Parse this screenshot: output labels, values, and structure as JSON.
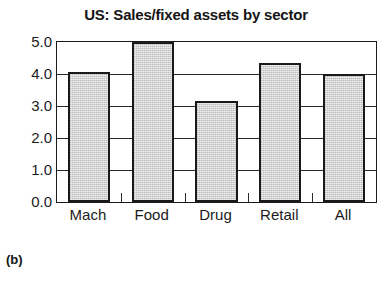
{
  "figure": {
    "caption": "(b)"
  },
  "chart_data": {
    "type": "bar",
    "title": "US: Sales/fixed assets by sector",
    "xlabel": "",
    "ylabel": "",
    "categories": [
      "Mach",
      "Food",
      "Drug",
      "Retail",
      "All"
    ],
    "values": [
      4.05,
      5.05,
      3.15,
      4.35,
      4.0
    ],
    "ylim": [
      0.0,
      5.0
    ],
    "ytick_labels": [
      "0.0",
      "1.0",
      "2.0",
      "3.0",
      "4.0",
      "5.0"
    ],
    "ytick_values": [
      0.0,
      1.0,
      2.0,
      3.0,
      4.0,
      5.0
    ],
    "grid": true,
    "legend": "none",
    "bar_fill_color": "#c7c7c7",
    "bar_edge_color": "#1a1a1a",
    "axis_color": "#1a1a1a",
    "background_color": "#ffffff"
  }
}
